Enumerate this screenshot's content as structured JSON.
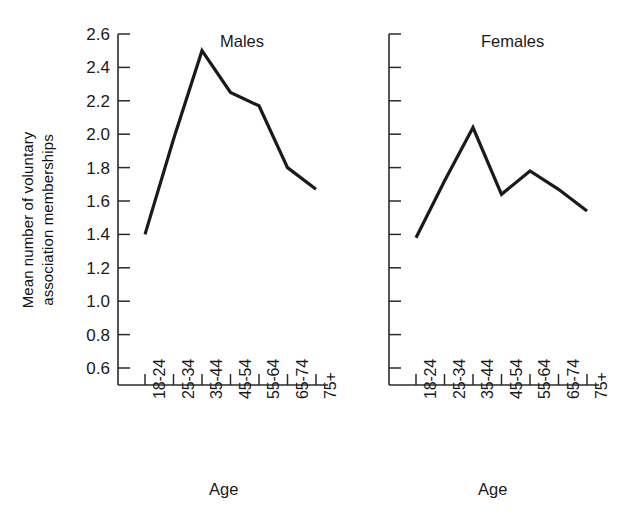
{
  "figure": {
    "ylabel_line1": "Mean number of voluntary",
    "ylabel_line2": "association memberships",
    "xlabel_left": "Age",
    "xlabel_right": "Age",
    "background": "#ffffff",
    "line_color": "#1a1a1a",
    "axis_color": "#2b2b2b"
  },
  "chart_data": {
    "type": "line",
    "title": "",
    "xlabel": "Age",
    "ylabel": "Mean number of voluntary association memberships",
    "categories": [
      "18-24",
      "25-34",
      "35-44",
      "45-54",
      "55-64",
      "65-74",
      "75+"
    ],
    "ylim": [
      0.5,
      2.6
    ],
    "yticks": [
      2.6,
      2.4,
      2.2,
      2.0,
      1.8,
      1.6,
      1.4,
      1.2,
      1.0,
      0.8,
      0.6
    ],
    "ytick_labels": [
      "2.6",
      "2.4",
      "2.2",
      "2.0",
      "1.8",
      "1.6",
      "1.4",
      "1.2",
      "1.0",
      "0.8",
      "0.6"
    ],
    "grid": false,
    "legend": "none",
    "panels": [
      {
        "name": "Males",
        "label": "Males",
        "values": [
          1.4,
          1.97,
          2.5,
          2.25,
          2.17,
          1.8,
          1.67
        ]
      },
      {
        "name": "Females",
        "label": "Females",
        "values": [
          1.38,
          1.72,
          2.04,
          1.64,
          1.78,
          1.67,
          1.54
        ]
      }
    ],
    "series": [
      {
        "name": "Males",
        "values": [
          1.4,
          1.97,
          2.5,
          2.25,
          2.17,
          1.8,
          1.67
        ]
      },
      {
        "name": "Females",
        "values": [
          1.38,
          1.72,
          2.04,
          1.64,
          1.78,
          1.67,
          1.54
        ]
      }
    ]
  }
}
